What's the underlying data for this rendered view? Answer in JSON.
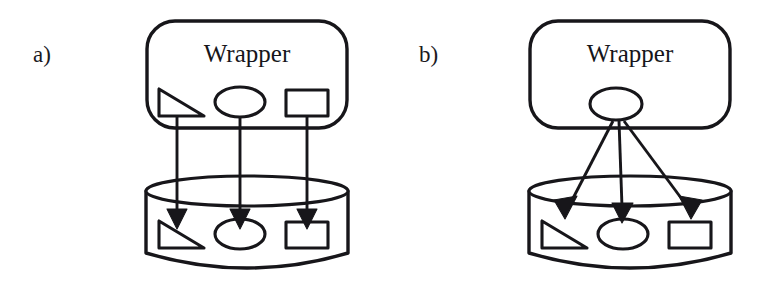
{
  "figure": {
    "width": 769,
    "height": 287,
    "background_color": "#ffffff",
    "ink_color": "#17161a"
  },
  "panels": [
    {
      "id": "panel-a",
      "label": "a)",
      "label_x": 33,
      "label_y": 62,
      "wrapper": {
        "title": "Wrapper",
        "title_x": 247,
        "title_y": 62,
        "box": {
          "x": 147,
          "y": 21,
          "width": 200,
          "height": 107,
          "radius": 28
        },
        "shapes": [
          {
            "name": "triangle",
            "type": "right-triangle",
            "x": 159,
            "y": 89,
            "width": 45,
            "height": 27
          },
          {
            "name": "ellipse",
            "type": "ellipse",
            "cx": 240,
            "cy": 102,
            "rx": 25,
            "ry": 15
          },
          {
            "name": "rectangle",
            "type": "rectangle",
            "x": 286,
            "y": 90,
            "width": 42,
            "height": 26
          }
        ]
      },
      "database": {
        "name": "database-cylinder",
        "box": {
          "x": 146,
          "y": 176,
          "width": 202,
          "height": 92
        },
        "ellipse_ry": 15,
        "shapes": [
          {
            "name": "triangle",
            "type": "right-triangle",
            "x": 159,
            "y": 221,
            "width": 45,
            "height": 27
          },
          {
            "name": "ellipse",
            "type": "ellipse",
            "cx": 240,
            "cy": 234,
            "rx": 25,
            "ry": 15
          },
          {
            "name": "rectangle",
            "type": "rectangle",
            "x": 286,
            "y": 222,
            "width": 42,
            "height": 26
          }
        ]
      },
      "arrows": [
        {
          "name": "arrow-triangle",
          "x1": 177,
          "y1": 116,
          "x2": 177,
          "y2": 213
        },
        {
          "name": "arrow-ellipse",
          "x1": 240,
          "y1": 117,
          "x2": 240,
          "y2": 213
        },
        {
          "name": "arrow-rectangle",
          "x1": 307,
          "y1": 116,
          "x2": 307,
          "y2": 213
        }
      ],
      "arrow_style": "three parallel vertical arrows, one per wrapper shape"
    },
    {
      "id": "panel-b",
      "label": "b)",
      "label_x": 419,
      "label_y": 62,
      "wrapper": {
        "title": "Wrapper",
        "title_x": 630,
        "title_y": 62,
        "box": {
          "x": 530,
          "y": 21,
          "width": 200,
          "height": 107,
          "radius": 28
        },
        "shapes": [
          {
            "name": "ellipse",
            "type": "ellipse",
            "cx": 616,
            "cy": 104,
            "rx": 26,
            "ry": 16
          }
        ]
      },
      "database": {
        "name": "database-cylinder",
        "box": {
          "x": 529,
          "y": 176,
          "width": 202,
          "height": 92
        },
        "ellipse_ry": 15,
        "shapes": [
          {
            "name": "triangle",
            "type": "right-triangle",
            "x": 542,
            "y": 221,
            "width": 45,
            "height": 27
          },
          {
            "name": "ellipse",
            "type": "ellipse",
            "cx": 623,
            "cy": 234,
            "rx": 25,
            "ry": 15
          },
          {
            "name": "rectangle",
            "type": "rectangle",
            "x": 669,
            "y": 222,
            "width": 42,
            "height": 26
          }
        ]
      },
      "arrows": [
        {
          "name": "arrow-to-triangle",
          "x1": 613,
          "y1": 121,
          "x2": 566,
          "y2": 211
        },
        {
          "name": "arrow-to-ellipse",
          "x1": 619,
          "y1": 121,
          "x2": 623,
          "y2": 212
        },
        {
          "name": "arrow-to-rectangle",
          "x1": 624,
          "y1": 121,
          "x2": 690,
          "y2": 211
        }
      ],
      "arrow_style": "three arrows radiating from one central wrapper ellipse"
    }
  ]
}
